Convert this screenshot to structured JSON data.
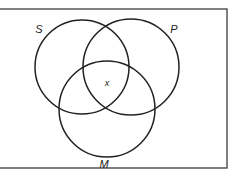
{
  "diagram": {
    "type": "venn",
    "frame": {
      "x": -2,
      "y": 9,
      "width": 229,
      "height": 159,
      "stroke": "#555555"
    },
    "circles": [
      {
        "name": "S",
        "cx": 82,
        "cy": 67,
        "r": 47,
        "label_x": 39,
        "label_y": 33
      },
      {
        "name": "P",
        "cx": 131,
        "cy": 67,
        "r": 48,
        "label_x": 174,
        "label_y": 33
      },
      {
        "name": "M",
        "cx": 107,
        "cy": 109,
        "r": 48,
        "label_x": 104,
        "label_y": 168
      }
    ],
    "marks": [
      {
        "text": "x",
        "x": 107,
        "y": 86
      }
    ],
    "stroke_color": "#222222"
  }
}
